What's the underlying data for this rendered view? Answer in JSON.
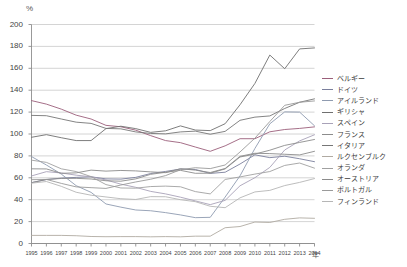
{
  "axes": {
    "y_unit": "%",
    "x_unit": "年",
    "y_ticks": [
      "0",
      "20",
      "40",
      "60",
      "80",
      "100",
      "120",
      "140",
      "160",
      "180",
      "200"
    ],
    "x_ticks": [
      "1995",
      "1996",
      "1997",
      "1998",
      "1999",
      "2000",
      "2001",
      "2002",
      "2003",
      "2004",
      "2005",
      "2006",
      "2007",
      "2008",
      "2009",
      "2010",
      "2011",
      "2012",
      "2013",
      "2014"
    ]
  },
  "legend": {
    "items": [
      {
        "label": "ベルギー",
        "color": "#9b5f7a"
      },
      {
        "label": "ドイツ",
        "color": "#7a7f9c"
      },
      {
        "label": "アイルランド",
        "color": "#8f9bb0"
      },
      {
        "label": "ギリシャ",
        "color": "#6f6f6f"
      },
      {
        "label": "スペイン",
        "color": "#a8a2b8"
      },
      {
        "label": "フランス",
        "color": "#8c8c8c"
      },
      {
        "label": "イタリア",
        "color": "#767676"
      },
      {
        "label": "ルクセンブルク",
        "color": "#b0aaa2"
      },
      {
        "label": "オランダ",
        "color": "#a0a0a0"
      },
      {
        "label": "オーストリア",
        "color": "#8b8b8b"
      },
      {
        "label": "ポルトガル",
        "color": "#9a9a9a"
      },
      {
        "label": "フィンランド",
        "color": "#b6b6b6"
      }
    ]
  },
  "chart_data": {
    "type": "line",
    "title": "",
    "xlabel": "年",
    "ylabel": "%",
    "ylim": [
      0,
      200
    ],
    "grid": true,
    "legend_position": "right",
    "x": [
      1995,
      1996,
      1997,
      1998,
      1999,
      2000,
      2001,
      2002,
      2003,
      2004,
      2005,
      2006,
      2007,
      2008,
      2009,
      2010,
      2011,
      2012,
      2013,
      2014
    ],
    "series": [
      {
        "name": "ベルギー",
        "color": "#9b5f7a",
        "values": [
          130.5,
          127.3,
          122.7,
          117.2,
          113.7,
          107.9,
          106.6,
          103.5,
          98.5,
          94.0,
          92.1,
          88.1,
          84.2,
          89.2,
          95.7,
          95.7,
          102.0,
          104.1,
          105.1,
          106.5
        ]
      },
      {
        "name": "ドイツ",
        "color": "#7a7f9c",
        "values": [
          55.6,
          58.4,
          59.7,
          60.4,
          60.9,
          59.0,
          58.8,
          60.4,
          63.9,
          65.8,
          68.0,
          67.6,
          64.0,
          65.1,
          72.6,
          81.0,
          78.4,
          79.7,
          77.4,
          74.7
        ]
      },
      {
        "name": "アイルランド",
        "color": "#8f9bb0",
        "values": [
          79.4,
          71.7,
          63.4,
          52.8,
          46.7,
          36.1,
          33.2,
          30.6,
          29.9,
          28.2,
          26.1,
          23.6,
          23.9,
          42.4,
          61.8,
          86.8,
          109.3,
          120.2,
          120.0,
          107.5
        ]
      },
      {
        "name": "ギリシャ",
        "color": "#6f6f6f",
        "values": [
          97.0,
          99.4,
          96.6,
          94.0,
          94.0,
          104.9,
          107.1,
          104.9,
          101.5,
          102.9,
          107.4,
          103.6,
          103.1,
          109.4,
          126.7,
          146.2,
          172.1,
          159.6,
          177.7,
          178.6
        ]
      },
      {
        "name": "スペイン",
        "color": "#a8a2b8",
        "values": [
          61.7,
          65.6,
          64.4,
          62.4,
          60.9,
          58.0,
          54.2,
          51.3,
          47.6,
          45.3,
          42.3,
          38.9,
          35.5,
          39.4,
          52.7,
          60.1,
          69.5,
          85.4,
          93.7,
          99.3
        ]
      },
      {
        "name": "フランス",
        "color": "#8c8c8c",
        "values": [
          55.5,
          58.5,
          59.4,
          59.5,
          58.9,
          57.3,
          56.9,
          59.0,
          63.2,
          65.0,
          66.8,
          64.1,
          64.2,
          68.1,
          79.0,
          81.7,
          85.2,
          89.6,
          92.3,
          95.0
        ]
      },
      {
        "name": "イタリア",
        "color": "#767676",
        "values": [
          117.0,
          116.7,
          113.7,
          110.8,
          109.7,
          105.1,
          104.7,
          101.9,
          100.5,
          100.1,
          101.9,
          102.6,
          99.8,
          102.4,
          112.5,
          115.4,
          116.5,
          123.3,
          129.0,
          132.1
        ]
      },
      {
        "name": "ルクセンブルク",
        "color": "#b0aaa2",
        "values": [
          7.4,
          7.4,
          7.4,
          7.1,
          6.4,
          6.2,
          6.3,
          6.3,
          6.1,
          6.3,
          6.1,
          6.7,
          6.7,
          14.4,
          15.5,
          19.6,
          19.2,
          22.1,
          23.4,
          23.0
        ]
      },
      {
        "name": "オランダ",
        "color": "#a0a0a0",
        "values": [
          76.1,
          74.1,
          68.2,
          65.7,
          61.1,
          53.8,
          50.7,
          50.5,
          52.0,
          52.4,
          51.8,
          47.4,
          45.3,
          58.5,
          60.8,
          63.4,
          65.7,
          71.3,
          73.5,
          68.8
        ]
      },
      {
        "name": "オーストリア",
        "color": "#8b8b8b",
        "values": [
          68.2,
          68.1,
          64.1,
          64.5,
          67.0,
          66.1,
          66.7,
          66.3,
          65.4,
          64.7,
          68.3,
          67.0,
          64.8,
          68.5,
          79.6,
          82.4,
          82.1,
          81.5,
          80.9,
          84.2
        ]
      },
      {
        "name": "ポルトガル",
        "color": "#9a9a9a",
        "values": [
          58.3,
          58.5,
          54.9,
          51.7,
          51.0,
          50.3,
          53.4,
          56.2,
          58.7,
          62.0,
          67.4,
          69.2,
          68.4,
          71.7,
          83.6,
          96.2,
          111.4,
          126.2,
          129.0,
          130.2
        ]
      },
      {
        "name": "フィンランド",
        "color": "#b6b6b6",
        "values": [
          55.1,
          56.6,
          52.2,
          46.8,
          44.1,
          42.5,
          40.9,
          40.2,
          42.8,
          42.7,
          40.0,
          38.2,
          34.0,
          32.7,
          41.7,
          47.1,
          48.5,
          52.9,
          55.8,
          59.3
        ]
      }
    ]
  }
}
